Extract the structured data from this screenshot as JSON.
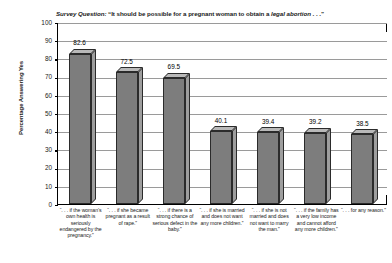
{
  "chart_data": {
    "type": "bar",
    "title_parts": {
      "label": "Survey Question:",
      "text_before": " “It should be possible for a pregnant woman to obtain a ",
      "emphasis": "legal abortion",
      "text_after": " . . .”"
    },
    "xlabel": "",
    "ylabel": "Percentage Answering Yes",
    "ylim": [
      0,
      100
    ],
    "ytick_step": 10,
    "yticks": [
      "100",
      "90",
      "80",
      "70",
      "60",
      "50",
      "40",
      "30",
      "20",
      "10",
      "0"
    ],
    "grid": true,
    "legend": "none",
    "categories": [
      "“. . . if the woman’s own health is seriously endangered by the pregnancy.”",
      "“. . . if she became pregnant as a result of rape.”",
      "“. . . if there is a strong chance of serious defect in the baby.”",
      "“. . . if she is married and does not want any more children.”",
      "“. . . if she is not married and does not want to marry the man.”",
      "“. . . if the family has a very low income and cannot afford any more children.”",
      "“. . . for any reason.”"
    ],
    "values": [
      82.6,
      72.5,
      69.5,
      40.1,
      39.4,
      39.2,
      38.5
    ],
    "value_labels": [
      "82.6",
      "72.5",
      "69.5",
      "40.1",
      "39.4",
      "39.2",
      "38.5"
    ],
    "colors": {
      "bar_front": "#7d7d7d",
      "bar_top": "#b9b9b9",
      "bar_side": "#9e9e9e",
      "bar_outline": "#2b2b2b",
      "axis": "#000000",
      "gridline": "#9a9a9a",
      "background": "#ffffff",
      "text": "#1a1a1a"
    }
  }
}
